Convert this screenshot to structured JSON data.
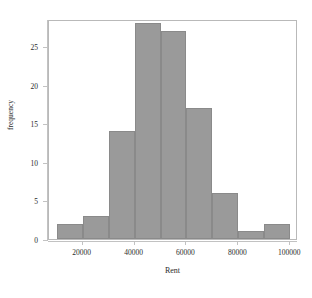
{
  "chart_data": {
    "type": "bar",
    "title": "",
    "xlabel": "Rent",
    "ylabel": "frequency",
    "bin_width": 10000,
    "bin_edges": [
      10000,
      20000,
      30000,
      40000,
      50000,
      60000,
      70000,
      80000,
      90000,
      100000
    ],
    "categories": [
      "10000-20000",
      "20000-30000",
      "30000-40000",
      "40000-50000",
      "50000-60000",
      "60000-70000",
      "70000-80000",
      "80000-90000",
      "90000-100000"
    ],
    "values": [
      2,
      3,
      14,
      28,
      27,
      17,
      6,
      1,
      2
    ],
    "xlim": [
      7000,
      103000
    ],
    "ylim": [
      0,
      28.5
    ],
    "x_ticks": [
      20000,
      40000,
      60000,
      80000,
      100000
    ],
    "x_tick_labels": [
      "20000",
      "40000",
      "60000",
      "80000",
      "100000"
    ],
    "y_ticks": [
      0,
      5,
      10,
      15,
      20,
      25
    ],
    "y_tick_labels": [
      "0",
      "5",
      "10",
      "15",
      "20",
      "25"
    ],
    "grid": false,
    "legend": null,
    "bar_color": "#9a9a9a",
    "bar_border_color": "#8a8a8a",
    "axis_color": "#c2c2c2",
    "background_color": "#ffffff"
  }
}
